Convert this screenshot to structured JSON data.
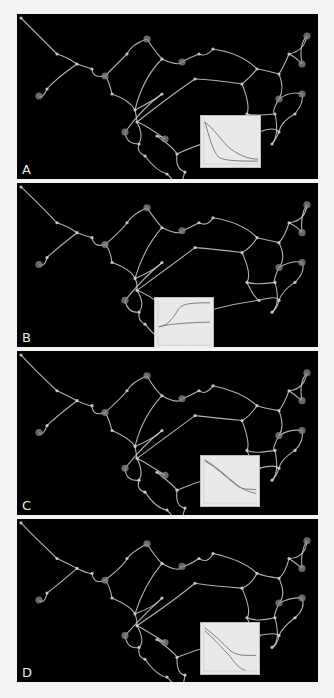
{
  "figure": {
    "background": "#f2f2f2",
    "panel_background": "#000000",
    "edge_color": "#cfcfcf",
    "node_color": "#8a8a8a",
    "inset_background": "#e9e9e9",
    "inset_curve_color": "#7a7a7a"
  },
  "network": {
    "nodes": [
      [
        4,
        4
      ],
      [
        40,
        40
      ],
      [
        60,
        50
      ],
      [
        75,
        55
      ],
      [
        88,
        62
      ],
      [
        30,
        75
      ],
      [
        22,
        82
      ],
      [
        95,
        80
      ],
      [
        118,
        96
      ],
      [
        120,
        108
      ],
      [
        110,
        40
      ],
      [
        130,
        25
      ],
      [
        145,
        45
      ],
      [
        165,
        48
      ],
      [
        145,
        80
      ],
      [
        182,
        40
      ],
      [
        196,
        35
      ],
      [
        240,
        55
      ],
      [
        262,
        60
      ],
      [
        272,
        40
      ],
      [
        290,
        22
      ],
      [
        285,
        50
      ],
      [
        262,
        85
      ],
      [
        258,
        100
      ],
      [
        285,
        80
      ],
      [
        278,
        100
      ],
      [
        230,
        100
      ],
      [
        242,
        118
      ],
      [
        262,
        118
      ],
      [
        255,
        130
      ],
      [
        160,
        140
      ],
      [
        128,
        142
      ],
      [
        108,
        118
      ],
      [
        122,
        130
      ],
      [
        140,
        122
      ],
      [
        150,
        160
      ],
      [
        148,
        125
      ],
      [
        168,
        158
      ],
      [
        162,
        185
      ],
      [
        178,
        65
      ],
      [
        225,
        70
      ]
    ],
    "edges": [
      [
        0,
        1
      ],
      [
        1,
        2
      ],
      [
        2,
        3
      ],
      [
        3,
        4
      ],
      [
        4,
        7
      ],
      [
        7,
        8
      ],
      [
        2,
        5
      ],
      [
        5,
        6
      ],
      [
        4,
        10
      ],
      [
        10,
        11
      ],
      [
        11,
        12
      ],
      [
        12,
        13
      ],
      [
        12,
        8
      ],
      [
        8,
        9
      ],
      [
        9,
        33
      ],
      [
        33,
        32
      ],
      [
        32,
        14
      ],
      [
        14,
        8
      ],
      [
        13,
        15
      ],
      [
        15,
        16
      ],
      [
        16,
        17
      ],
      [
        17,
        18
      ],
      [
        18,
        19
      ],
      [
        19,
        20
      ],
      [
        20,
        21
      ],
      [
        21,
        19
      ],
      [
        18,
        22
      ],
      [
        22,
        23
      ],
      [
        22,
        24
      ],
      [
        24,
        25
      ],
      [
        23,
        26
      ],
      [
        26,
        27
      ],
      [
        27,
        28
      ],
      [
        28,
        25
      ],
      [
        28,
        29
      ],
      [
        23,
        29
      ],
      [
        9,
        36
      ],
      [
        36,
        34
      ],
      [
        34,
        30
      ],
      [
        30,
        37
      ],
      [
        37,
        38
      ],
      [
        35,
        38
      ],
      [
        33,
        31
      ],
      [
        31,
        35
      ],
      [
        9,
        39
      ],
      [
        39,
        40
      ],
      [
        17,
        40
      ],
      [
        40,
        26
      ],
      [
        27,
        30
      ]
    ],
    "hubs": [
      4,
      6,
      11,
      13,
      20,
      21,
      22,
      24,
      32,
      36,
      38
    ]
  },
  "panels": [
    {
      "label": "A",
      "top": 14,
      "height": 165,
      "inset": {
        "left": 183,
        "top": 101,
        "width": 59,
        "height": 51
      },
      "curves": [
        "M4,6 C14,14 20,24 28,32 C36,38 46,44 58,44",
        "M4,6 C8,20 12,36 18,42 C24,46 40,46 58,46"
      ]
    },
    {
      "label": "B",
      "top": 183,
      "height": 164,
      "inset": {
        "left": 137,
        "top": 114,
        "width": 58,
        "height": 50
      },
      "curves": [
        "M4,30 C14,28 18,22 24,12 C28,6 36,5 57,5",
        "M4,30 C14,27 30,26 57,25"
      ]
    },
    {
      "label": "C",
      "top": 351,
      "height": 164,
      "inset": {
        "left": 183,
        "top": 104,
        "width": 58,
        "height": 50
      },
      "curves": [
        "M4,5 C16,12 26,22 36,30 C44,36 50,34 57,35",
        "M4,4 C16,11 26,21 36,29 C44,36 50,37 57,39"
      ]
    },
    {
      "label": "D",
      "top": 519,
      "height": 163,
      "inset": {
        "left": 183,
        "top": 103,
        "width": 58,
        "height": 51
      },
      "curves": [
        "M4,5 C14,12 22,20 30,28 C38,34 46,33 57,33",
        "M4,8 C14,16 22,26 30,34 C36,42 40,47 46,48"
      ]
    }
  ]
}
